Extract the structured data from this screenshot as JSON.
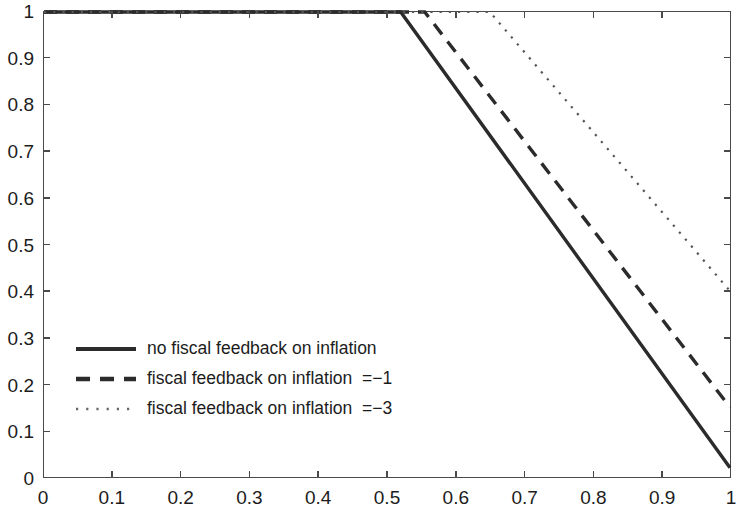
{
  "chart_data": {
    "type": "line",
    "title": "",
    "xlabel": "",
    "ylabel": "",
    "xlim": [
      0,
      1
    ],
    "ylim": [
      0,
      1
    ],
    "grid": false,
    "legend_position": "center-left",
    "xticks": [
      "0",
      "0.1",
      "0.2",
      "0.3",
      "0.4",
      "0.5",
      "0.6",
      "0.7",
      "0.8",
      "0.9",
      "1"
    ],
    "xtick_values": [
      0,
      0.1,
      0.2,
      0.3,
      0.4,
      0.5,
      0.6,
      0.7,
      0.8,
      0.9,
      1
    ],
    "yticks": [
      "0",
      "0.1",
      "0.2",
      "0.3",
      "0.4",
      "0.5",
      "0.6",
      "0.7",
      "0.8",
      "0.9",
      "1"
    ],
    "ytick_values": [
      0,
      0.1,
      0.2,
      0.3,
      0.4,
      0.5,
      0.6,
      0.7,
      0.8,
      0.9,
      1
    ],
    "series": [
      {
        "name": "no fiscal feedback on inflation",
        "style": "solid",
        "color": "#2b2b2b",
        "width": 3.4,
        "x": [
          0,
          0.52,
          1
        ],
        "values": [
          1,
          1,
          0.02
        ]
      },
      {
        "name": "fiscal feedback on inflation  =−1",
        "style": "dashed",
        "color": "#2b2b2b",
        "width": 3.4,
        "x": [
          0,
          0.555,
          1
        ],
        "values": [
          1,
          1,
          0.15
        ]
      },
      {
        "name": "fiscal feedback on inflation  =−3",
        "style": "dotted",
        "color": "#555555",
        "width": 2.2,
        "x": [
          0,
          0.65,
          1
        ],
        "values": [
          1,
          1,
          0.4
        ]
      }
    ]
  },
  "legend": {
    "entries": [
      {
        "label": "no fiscal feedback on inflation"
      },
      {
        "label": "fiscal feedback on inflation  =−1"
      },
      {
        "label": "fiscal feedback on inflation  =−3"
      }
    ]
  },
  "axes": {
    "x_tick_labels": [
      "0",
      "0.1",
      "0.2",
      "0.3",
      "0.4",
      "0.5",
      "0.6",
      "0.7",
      "0.8",
      "0.9",
      "1"
    ],
    "y_tick_labels": [
      "0",
      "0.1",
      "0.2",
      "0.3",
      "0.4",
      "0.5",
      "0.6",
      "0.7",
      "0.8",
      "0.9",
      "1"
    ]
  },
  "colors": {
    "axis": "#4a4a4a",
    "text": "#1c1c1c",
    "line_dark": "#2b2b2b",
    "line_light": "#555555",
    "background": "#ffffff"
  }
}
